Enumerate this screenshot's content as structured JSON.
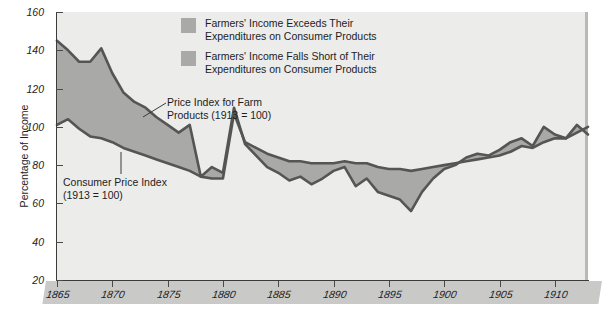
{
  "chart": {
    "axis_title_y": "Percentage of Income",
    "y_ticks": [
      20,
      40,
      60,
      80,
      100,
      120,
      140,
      160
    ],
    "x_ticks": [
      1865,
      1870,
      1875,
      1880,
      1885,
      1890,
      1895,
      1900,
      1905,
      1910
    ]
  },
  "legend": {
    "items": [
      {
        "line1": "Farmers' Income Exceeds Their",
        "line2": "Expenditures on Consumer Products",
        "color": "#a9a9a7"
      },
      {
        "line1": "Farmers' Income Falls Short of Their",
        "line2": "Expenditures on Consumer Products",
        "color": "#a9a9a7"
      }
    ]
  },
  "annotations": {
    "farm": {
      "line1": "Price Index for Farm",
      "line2": "Products (1913 = 100)"
    },
    "cpi": {
      "line1": "Consumer Price Index",
      "line2": "(1913 = 100)"
    }
  },
  "colors": {
    "plot_background": "#ececeb",
    "fill": "#a9a9a7",
    "line": "#555555",
    "axis": "#3b3b3b",
    "xband": "#c9c9c7"
  },
  "chart_data": {
    "type": "line",
    "title": "",
    "xlabel": "",
    "ylabel": "Percentage of Income",
    "xlim": [
      1865,
      1913
    ],
    "ylim": [
      20,
      160
    ],
    "grid": false,
    "legend_position": "top-center",
    "x": [
      1865,
      1866,
      1867,
      1868,
      1869,
      1870,
      1871,
      1872,
      1873,
      1874,
      1875,
      1876,
      1877,
      1878,
      1879,
      1880,
      1881,
      1882,
      1883,
      1884,
      1885,
      1886,
      1887,
      1888,
      1889,
      1890,
      1891,
      1892,
      1893,
      1894,
      1895,
      1896,
      1897,
      1898,
      1899,
      1900,
      1901,
      1902,
      1903,
      1904,
      1905,
      1906,
      1907,
      1908,
      1909,
      1910,
      1911,
      1912,
      1913
    ],
    "series": [
      {
        "name": "Price Index for Farm Products (1913 = 100)",
        "values": [
          145,
          140,
          134,
          134,
          141,
          128,
          118,
          113,
          110,
          105,
          101,
          97,
          101,
          74,
          79,
          76,
          110,
          91,
          85,
          79,
          76,
          72,
          74,
          70,
          73,
          77,
          79,
          69,
          73,
          66,
          64,
          62,
          56,
          66,
          73,
          78,
          80,
          84,
          86,
          85,
          88,
          92,
          94,
          90,
          100,
          96,
          94,
          101,
          96
        ]
      },
      {
        "name": "Consumer Price Index (1913 = 100)",
        "values": [
          101,
          104,
          99,
          95,
          94,
          92,
          89,
          87,
          85,
          83,
          81,
          79,
          77,
          74,
          73,
          73,
          107,
          92,
          89,
          86,
          84,
          82,
          82,
          81,
          81,
          81,
          82,
          81,
          81,
          79,
          78,
          78,
          77,
          78,
          79,
          80,
          81,
          82,
          83,
          84,
          85,
          87,
          90,
          89,
          92,
          94,
          94,
          97,
          100
        ]
      }
    ]
  }
}
